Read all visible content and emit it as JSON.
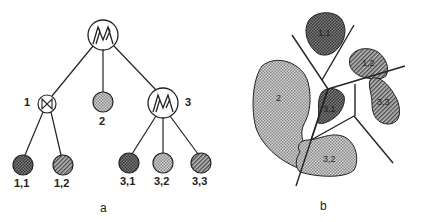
{
  "figure_a": {
    "caption": "a",
    "root": {
      "label": "",
      "glyph": "mixture-icon"
    },
    "nodes": [
      {
        "id": "1",
        "label": "1",
        "glyph": "bowtie-icon"
      },
      {
        "id": "2",
        "label": "2",
        "fill": "light-dot"
      },
      {
        "id": "3",
        "label": "3",
        "glyph": "mixture-icon"
      }
    ],
    "leaves": [
      {
        "id": "1,1",
        "label": "1,1",
        "fill": "dark-dot"
      },
      {
        "id": "1,2",
        "label": "1,2",
        "fill": "hatch"
      },
      {
        "id": "3,1",
        "label": "3,1",
        "fill": "dark-dot"
      },
      {
        "id": "3,2",
        "label": "3,2",
        "fill": "light-dot"
      },
      {
        "id": "3,3",
        "label": "3,3",
        "fill": "hatch"
      }
    ]
  },
  "figure_b": {
    "caption": "b",
    "regions": [
      {
        "label": "1,1",
        "fill": "dark-dot"
      },
      {
        "label": "1,2",
        "fill": "hatch"
      },
      {
        "label": "2",
        "fill": "light-dot"
      },
      {
        "label": "3,1",
        "fill": "dark-dot"
      },
      {
        "label": "3,2",
        "fill": "light-dot"
      },
      {
        "label": "3,3",
        "fill": "hatch"
      }
    ]
  },
  "colors": {
    "stroke": "#222222",
    "dark_fill": "#6a6a6a",
    "light_fill": "#b8b8b8",
    "hatch_fill": "#8c8c8c"
  }
}
